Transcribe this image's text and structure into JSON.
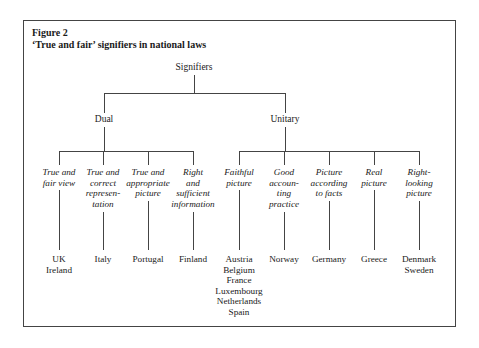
{
  "figure": {
    "number": "Figure 2",
    "title": "‘True and fair’ signifiers in national laws"
  },
  "tree": {
    "root": "Signifiers",
    "branches": [
      {
        "label": "Dual",
        "children": [
          {
            "signifier": [
              "True and",
              "fair view"
            ],
            "countries": [
              "UK",
              "Ireland"
            ]
          },
          {
            "signifier": [
              "True and",
              "correct",
              "represen-",
              "tation"
            ],
            "countries": [
              "Italy"
            ]
          },
          {
            "signifier": [
              "True and",
              "appropriate",
              "picture"
            ],
            "countries": [
              "Portugal"
            ]
          },
          {
            "signifier": [
              "Right",
              "and",
              "sufficient",
              "information"
            ],
            "countries": [
              "Finland"
            ]
          }
        ]
      },
      {
        "label": "Unitary",
        "children": [
          {
            "signifier": [
              "Faithful",
              "picture"
            ],
            "countries": [
              "Austria",
              "Belgium",
              "France",
              "Luxembourg",
              "Netherlands",
              "Spain"
            ]
          },
          {
            "signifier": [
              "Good",
              "accoun-",
              "ting",
              "practice"
            ],
            "countries": [
              "Norway"
            ]
          },
          {
            "signifier": [
              "Picture",
              "according",
              "to facts"
            ],
            "countries": [
              "Germany"
            ]
          },
          {
            "signifier": [
              "Real",
              "picture"
            ],
            "countries": [
              "Greece"
            ]
          },
          {
            "signifier": [
              "Right-",
              "looking",
              "picture"
            ],
            "countries": [
              "Denmark",
              "Sweden"
            ]
          }
        ]
      }
    ]
  },
  "colors": {
    "line": "#444444",
    "text": "#1a1a1a",
    "background": "#ffffff"
  }
}
